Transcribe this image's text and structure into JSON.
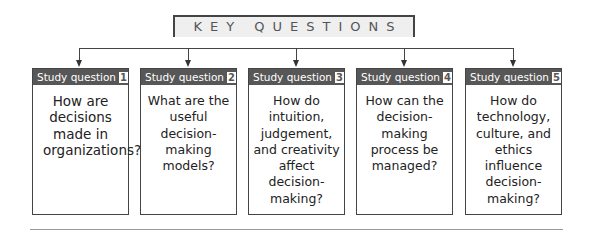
{
  "title": "KEY QUESTIONS",
  "cards": [
    {
      "label": "Study question",
      "number": "1",
      "text": "How are decisions made in organizations?"
    },
    {
      "label": "Study question",
      "number": "2",
      "text": "What are the useful decision-making models?"
    },
    {
      "label": "Study question",
      "number": "3",
      "text": "How do intuition, judgement, and creativity affect decision-making?"
    },
    {
      "label": "Study question",
      "number": "4",
      "text": "How can the decision-making process be managed?"
    },
    {
      "label": "Study question",
      "number": "5",
      "text": "How do technology, culture, and ethics influence decision-making?"
    }
  ],
  "colors": {
    "header": "#575757",
    "line": "#444444",
    "title_bg": "#efefef"
  }
}
